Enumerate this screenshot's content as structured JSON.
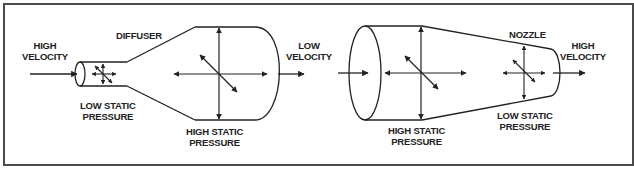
{
  "figure": {
    "diffuser": {
      "name_label": "DIFFUSER",
      "inlet_label": "HIGH\nVELOCITY",
      "inlet_pressure_label": "LOW STATIC\nPRESSURE",
      "outlet_pressure_label": "HIGH STATIC\nPRESSURE",
      "outlet_label": "LOW\nVELOCITY"
    },
    "nozzle": {
      "name_label": "NOZZLE",
      "inlet_pressure_label": "HIGH STATIC\nPRESSURE",
      "outlet_pressure_label": "LOW STATIC\nPRESSURE",
      "outlet_label": "HIGH\nVELOCITY"
    },
    "colors": {
      "line": "#222222",
      "frame": "#4a4a4a",
      "background": "#ffffff"
    }
  }
}
